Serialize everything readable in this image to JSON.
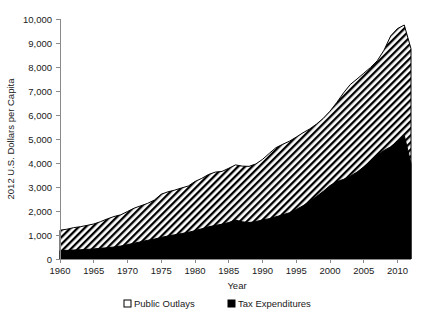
{
  "chart_data": {
    "type": "area",
    "title": "",
    "subtitle": "",
    "xlabel": "Year",
    "ylabel": "2012 U.S. Dollars per Capita",
    "xlim": [
      1960,
      2012
    ],
    "ylim": [
      0,
      10000
    ],
    "grid": false,
    "stacked": true,
    "legend_position": "bottom",
    "x_ticks": [
      1960,
      1965,
      1970,
      1975,
      1980,
      1985,
      1990,
      1995,
      2000,
      2005,
      2010
    ],
    "x_tick_labels": [
      "1960",
      "1965",
      "1970",
      "1975",
      "1980",
      "1985",
      "1990",
      "1995",
      "2000",
      "2005",
      "2010"
    ],
    "y_ticks": [
      0,
      1000,
      2000,
      3000,
      4000,
      5000,
      6000,
      7000,
      8000,
      9000,
      10000
    ],
    "y_tick_labels": [
      "0",
      "1,000",
      "2,000",
      "3,000",
      "4,000",
      "5,000",
      "6,000",
      "7,000",
      "8,000",
      "9,000",
      "10,000"
    ],
    "x": [
      1960,
      1961,
      1962,
      1963,
      1964,
      1965,
      1966,
      1967,
      1968,
      1969,
      1970,
      1971,
      1972,
      1973,
      1974,
      1975,
      1976,
      1977,
      1978,
      1979,
      1980,
      1981,
      1982,
      1983,
      1984,
      1985,
      1986,
      1987,
      1988,
      1989,
      1990,
      1991,
      1992,
      1993,
      1994,
      1995,
      1996,
      1997,
      1998,
      1999,
      2000,
      2001,
      2002,
      2003,
      2004,
      2005,
      2006,
      2007,
      2008,
      2009,
      2010,
      2011,
      2012
    ],
    "series": [
      {
        "name": "Tax Expenditures",
        "color": "#000000",
        "pattern": "solid-black",
        "values": [
          350,
          360,
          375,
          385,
          400,
          420,
          445,
          470,
          500,
          540,
          600,
          660,
          720,
          780,
          830,
          900,
          960,
          1010,
          1060,
          1110,
          1180,
          1260,
          1340,
          1400,
          1450,
          1520,
          1620,
          1550,
          1520,
          1560,
          1630,
          1680,
          1760,
          1840,
          1930,
          2060,
          2220,
          2400,
          2600,
          2820,
          3060,
          3220,
          3320,
          3450,
          3620,
          3840,
          4080,
          4320,
          4520,
          4680,
          4900,
          5150,
          3980
        ]
      },
      {
        "name": "Public Outlays",
        "color": "#ffffff",
        "pattern": "diagonal-hatch",
        "values": [
          850,
          880,
          930,
          960,
          1000,
          1040,
          1110,
          1200,
          1270,
          1300,
          1380,
          1460,
          1500,
          1540,
          1630,
          1800,
          1840,
          1860,
          1900,
          1930,
          2050,
          2100,
          2180,
          2220,
          2200,
          2260,
          2300,
          2320,
          2340,
          2400,
          2520,
          2720,
          2880,
          2940,
          2980,
          3020,
          3040,
          3020,
          3020,
          3040,
          3100,
          3300,
          3600,
          3820,
          3880,
          3900,
          3900,
          3940,
          4180,
          4620,
          4700,
          4600,
          4780
        ]
      }
    ],
    "totals": [
      1200,
      1240,
      1305,
      1345,
      1400,
      1460,
      1555,
      1670,
      1770,
      1840,
      1980,
      2120,
      2220,
      2320,
      2460,
      2700,
      2800,
      2870,
      2960,
      3040,
      3230,
      3360,
      3520,
      3620,
      3650,
      3780,
      3920,
      3870,
      3860,
      3960,
      4150,
      4400,
      4640,
      4780,
      4910,
      5080,
      5260,
      5420,
      5620,
      5860,
      6160,
      6520,
      6920,
      7270,
      7500,
      7740,
      7980,
      8260,
      8700,
      9300,
      9600,
      9750,
      8760
    ],
    "legend": [
      {
        "label": "Public Outlays",
        "marker": "white-square"
      },
      {
        "label": "Tax Expenditures",
        "marker": "black-square"
      }
    ]
  }
}
